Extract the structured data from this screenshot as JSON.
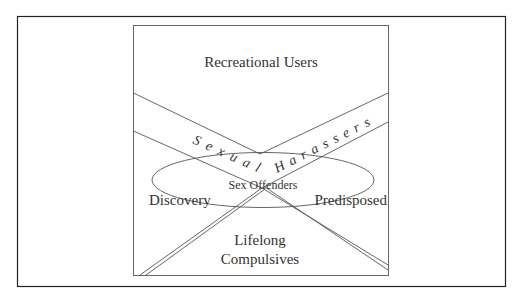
{
  "diagram": {
    "colors": {
      "line": "#555555",
      "frame": "#222222",
      "text": "#333333",
      "background": "#ffffff"
    },
    "regions": {
      "top": "Recreational Users",
      "band": "Sexual Harassers",
      "band_left": "Sexual",
      "band_right": "Harassers",
      "center": "Sex Offenders",
      "left": "Discovery",
      "right": "Predisposed",
      "bottom_line1": "Lifelong",
      "bottom_line2": "Compulsives"
    }
  }
}
